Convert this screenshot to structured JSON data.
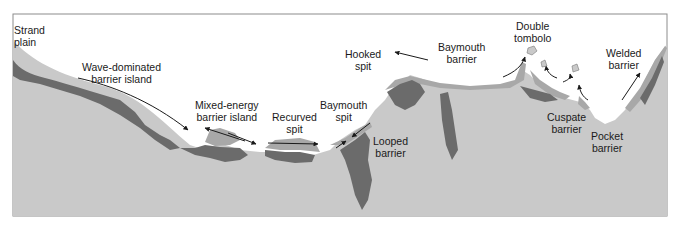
{
  "figure": {
    "type": "coastal barrier types schematic",
    "colors": {
      "water": "#ffffff",
      "land": "#c9c9c9",
      "lagoon_marsh": "#6b6b6b",
      "barrier_sand": "#a8a8a8",
      "frame": "#8c8c8c",
      "arrow": "#1a1a1a",
      "text": "#1a1a1a"
    }
  },
  "labels": [
    {
      "id": "strand-plain",
      "text": "Strand\nplain",
      "x": 14,
      "y": 24,
      "align": "left"
    },
    {
      "id": "wave-dominated-barrier-island",
      "text": "Wave-dominated\nbarrier island",
      "x": 82,
      "y": 61
    },
    {
      "id": "mixed-energy-barrier-island",
      "text": "Mixed-energy\nbarrier island",
      "x": 195,
      "y": 99
    },
    {
      "id": "recurved-spit",
      "text": "Recurved\nspit",
      "x": 272,
      "y": 111
    },
    {
      "id": "baymouth-spit",
      "text": "Baymouth\nspit",
      "x": 320,
      "y": 99
    },
    {
      "id": "looped-barrier",
      "text": "Looped\nbarrier",
      "x": 373,
      "y": 135
    },
    {
      "id": "hooked-spit",
      "text": "Hooked\nspit",
      "x": 345,
      "y": 48
    },
    {
      "id": "baymouth-barrier",
      "text": "Baymouth\nbarrier",
      "x": 438,
      "y": 41
    },
    {
      "id": "double-tombolo",
      "text": "Double\ntombolo",
      "x": 514,
      "y": 20
    },
    {
      "id": "welded-barrier",
      "text": "Welded\nbarrier",
      "x": 606,
      "y": 47
    },
    {
      "id": "cuspate-barrier",
      "text": "Cuspate\nbarrier",
      "x": 547,
      "y": 111
    },
    {
      "id": "pocket-barrier",
      "text": "Pocket\nbarrier",
      "x": 591,
      "y": 130
    }
  ]
}
